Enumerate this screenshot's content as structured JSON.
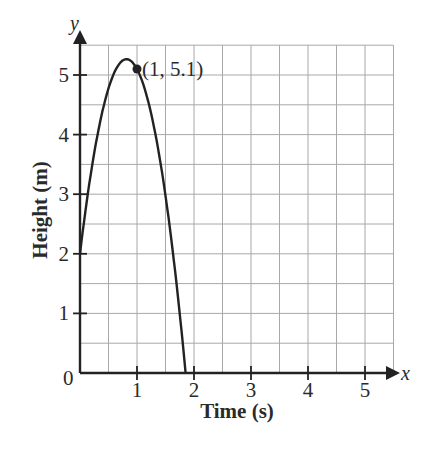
{
  "chart_data": {
    "type": "line",
    "title": "",
    "xlabel": "Time (s)",
    "ylabel": "Height (m)",
    "x_axis_var": "x",
    "y_axis_var": "y",
    "xlim": [
      0,
      5.5
    ],
    "ylim": [
      0,
      5.5
    ],
    "x_ticks": [
      1,
      2,
      3,
      4,
      5
    ],
    "y_ticks": [
      1,
      2,
      3,
      4,
      5
    ],
    "origin_label": "0",
    "grid": true,
    "grid_step": 0.5,
    "series": [
      {
        "name": "height",
        "equation": "h(t) = -4.9t^2 + 8t + 2",
        "x": [
          0,
          0.2,
          0.4,
          0.6,
          0.8,
          0.816,
          1.0,
          1.2,
          1.4,
          1.6,
          1.8,
          1.853
        ],
        "values": [
          2.0,
          3.4,
          4.42,
          5.04,
          5.26,
          5.27,
          5.1,
          4.54,
          3.6,
          2.26,
          0.52,
          0.0
        ]
      }
    ],
    "annotations": [
      {
        "x": 1,
        "y": 5.1,
        "label": "(1, 5.1)"
      }
    ],
    "colors": {
      "curve": "#222222",
      "grid": "#a8a8a8",
      "axis": "#222222"
    }
  }
}
